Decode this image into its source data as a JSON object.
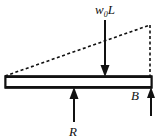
{
  "figure": {
    "type": "free-body-diagram",
    "background_color": "#ffffff",
    "line_color": "#111111",
    "beam_fill": "#ffffff"
  },
  "labels": {
    "resultant_load": {
      "base": "w",
      "subscript": "0",
      "suffix": "L",
      "full_text": "w0L",
      "x": 95,
      "y": 14
    },
    "reaction_left": {
      "text": "R",
      "x": 69,
      "y": 136
    },
    "reaction_right": {
      "text": "B",
      "x": 131,
      "y": 100
    }
  },
  "beam": {
    "x": 5,
    "y": 76,
    "width": 147,
    "height": 12,
    "edge_thickness": 2.5
  },
  "load_triangle": {
    "style": "dashed",
    "apex_x": 150,
    "apex_y": 25,
    "base_left_x": 5,
    "base_left_y": 76,
    "vertical_x": 150,
    "vertical_top_y": 25,
    "vertical_bottom_y": 76,
    "dash_pattern": "3,2.5"
  },
  "arrows": [
    {
      "name": "resultant-load-arrow",
      "direction": "down",
      "x": 105,
      "from_y": 20,
      "to_y": 76,
      "head_width": 9,
      "head_length": 11,
      "shaft_width": 2
    },
    {
      "name": "reaction-r-arrow",
      "direction": "up",
      "x": 74,
      "from_y": 122,
      "to_y": 88,
      "head_width": 9,
      "head_length": 11,
      "shaft_width": 2
    },
    {
      "name": "reaction-b-arrow",
      "direction": "up",
      "x": 151,
      "from_y": 116,
      "to_y": 88,
      "head_width": 8,
      "head_length": 10,
      "shaft_width": 2
    }
  ]
}
